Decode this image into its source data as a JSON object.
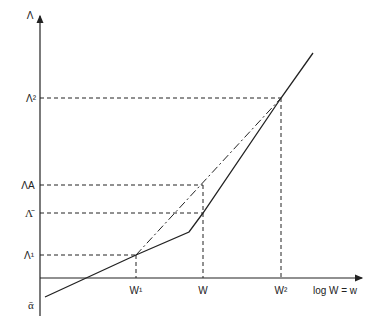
{
  "diagram": {
    "y_axis_label": "Λ",
    "x_axis_label": "log W = w",
    "y_ticks": {
      "lambda2": "Λ²",
      "lambdaA": "ΛA",
      "lambda_bar": "Λ̄",
      "lambda1": "Λ¹",
      "alpha_bar": "ᾱ"
    },
    "x_ticks": {
      "w1": "W¹",
      "w": "W",
      "w2": "W²"
    },
    "series": [
      {
        "name": "solid-piecewise-curve",
        "style": "solid",
        "points": [
          [
            45,
            297
          ],
          [
            136,
            255
          ],
          [
            189,
            232
          ],
          [
            203,
            213
          ],
          [
            281,
            98
          ],
          [
            313,
            53
          ]
        ]
      },
      {
        "name": "dash-dot-chord",
        "style": "dash-dot",
        "points": [
          [
            136,
            255
          ],
          [
            281,
            98
          ]
        ]
      }
    ],
    "colors": {
      "line": "#222222",
      "background": "#ffffff"
    }
  }
}
